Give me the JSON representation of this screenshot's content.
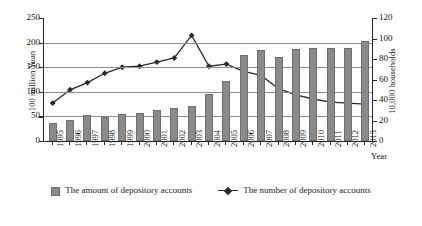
{
  "chart_data": {
    "type": "bar",
    "title": "",
    "xlabel": "Year",
    "ylabel": "100 million Yuan",
    "ylabel_right": "10,000 households",
    "categories": [
      "1995",
      "1996",
      "1997",
      "1998",
      "1999",
      "2000",
      "2001",
      "2002",
      "2003",
      "2004",
      "2005",
      "2006",
      "2007",
      "2008",
      "2009",
      "2010",
      "2011",
      "2012",
      "2013"
    ],
    "ylim": [
      0,
      250
    ],
    "yticks": [
      "0",
      "50",
      "100",
      "150",
      "200",
      "250"
    ],
    "ylim_right": [
      0,
      120
    ],
    "yticks_right": [
      "0",
      "20",
      "40",
      "60",
      "80",
      "100",
      "120"
    ],
    "grid": true,
    "legend_position": "bottom",
    "series": [
      {
        "name": "The amount of depository accounts",
        "type": "bar",
        "axis": "left",
        "unit": "100 million Yuan",
        "color": "#8a8a8a",
        "values": [
          37,
          42,
          53,
          49,
          55,
          57,
          63,
          67,
          72,
          95,
          122,
          174,
          185,
          171,
          188,
          190,
          189,
          189,
          203
        ]
      },
      {
        "name": "The number of depository accounts",
        "type": "line",
        "axis": "right",
        "unit": "10,000 households",
        "color": "#2b2b2b",
        "marker": "diamond",
        "values": [
          37,
          50,
          57,
          66,
          72,
          73,
          77,
          81,
          103,
          73,
          75,
          68,
          64,
          51,
          45,
          41,
          38,
          37,
          36
        ]
      }
    ]
  },
  "legend": {
    "items": [
      {
        "marker": "bar-swatch",
        "label": "The amount of depository accounts"
      },
      {
        "marker": "line-diamond-swatch",
        "label": "The number of depository accounts"
      }
    ]
  }
}
